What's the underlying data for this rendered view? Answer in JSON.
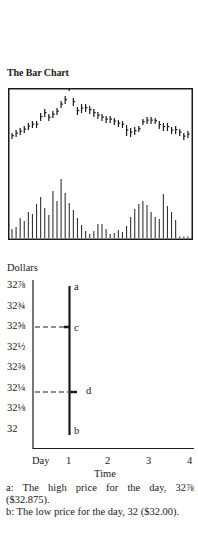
{
  "chart_data": [
    {
      "type": "bar",
      "subtype": "ohlc-price-bars-with-volume",
      "title": "The Bar Chart",
      "axes": "none shown (boxed panel)",
      "price_bars": {
        "count": 44,
        "description": "Daily high-low bars with close tick; rising trend to a peak near bar 14, decline to a trough near bar 28, secondary rise near bar 31, then decline",
        "high": [
          133,
          130,
          128,
          126,
          123,
          121,
          121,
          113,
          109,
          114,
          111,
          108,
          101,
          96,
          80,
          98,
          107,
          104,
          104,
          106,
          109,
          112,
          114,
          116,
          116,
          118,
          120,
          121,
          125,
          128,
          127,
          126,
          119,
          117,
          117,
          118,
          121,
          123,
          123,
          127,
          126,
          129,
          133,
          131
        ],
        "low": [
          139,
          137,
          135,
          133,
          130,
          128,
          128,
          121,
          117,
          121,
          118,
          115,
          108,
          104,
          91,
          106,
          115,
          113,
          112,
          114,
          117,
          119,
          121,
          123,
          123,
          125,
          127,
          128,
          136,
          137,
          135,
          132,
          125,
          124,
          124,
          124,
          129,
          131,
          131,
          134,
          134,
          136,
          140,
          138
        ]
      },
      "volume_bars": {
        "count": 44,
        "values": [
          9,
          11,
          20,
          17,
          26,
          24,
          34,
          41,
          30,
          23,
          47,
          37,
          59,
          45,
          35,
          28,
          20,
          13,
          7,
          4,
          7,
          14,
          14,
          9,
          4,
          5,
          8,
          6,
          12,
          21,
          29,
          34,
          37,
          33,
          26,
          21,
          19,
          44,
          32,
          26,
          18,
          0,
          0,
          0
        ]
      }
    },
    {
      "type": "bar",
      "subtype": "single-day-ohlc-bar-explainer",
      "ylabel": "Dollars",
      "xlabel": "Time",
      "x_ticks": [
        "Day",
        "1",
        "2",
        "3",
        "4"
      ],
      "y_ticks": [
        "32⅞",
        "32¾",
        "32⅝",
        "32½",
        "32⅜",
        "32¼",
        "32⅛",
        "32"
      ],
      "y_values": [
        32.875,
        32.75,
        32.625,
        32.5,
        32.375,
        32.25,
        32.125,
        32.0
      ],
      "bar": {
        "day": 1,
        "high": 32.875,
        "low": 32.0,
        "open": 32.625,
        "close": 32.25,
        "labels": {
          "high": "a",
          "low": "b",
          "open": "c",
          "close": "d"
        }
      }
    }
  ],
  "page": {
    "title": "The Bar Chart",
    "lower": {
      "ylabel": "Dollars",
      "xlabel": "Time",
      "y_ticks": [
        "32⅞",
        "32¾",
        "32⅝",
        "32½",
        "32⅜",
        "32¼",
        "32⅛",
        "32"
      ],
      "x_ticks": [
        "Day",
        "1",
        "2",
        "3",
        "4"
      ],
      "labels": {
        "a": "a",
        "b": "b",
        "c": "c",
        "d": "d"
      }
    },
    "notes": [
      "a: The high price for the day, 32⅞ ($32.875).",
      "b: The low price for the day, 32 ($32.00)."
    ]
  }
}
